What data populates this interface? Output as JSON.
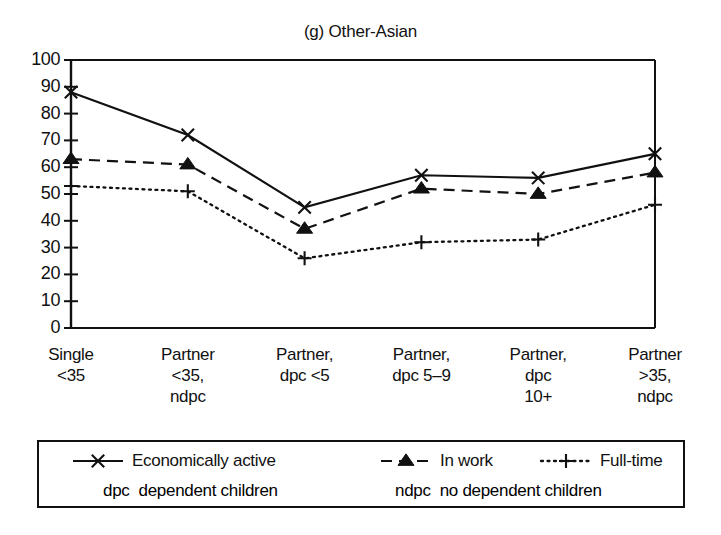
{
  "chart_data": {
    "type": "line",
    "title": "(g) Other-Asian",
    "xlabel": "",
    "ylabel": "",
    "ylim": [
      0,
      100
    ],
    "ytick_step": 10,
    "grid": false,
    "legend_position": "below-plot",
    "categories": [
      "Single\n<35",
      "Partner\n<35,\nndpc",
      "Partner,\ndpc <5",
      "Partner,\ndpc 5–9",
      "Partner,\ndpc\n10+",
      "Partner\n>35,\nndpc"
    ],
    "yticks": [
      "0",
      "10",
      "20",
      "30",
      "40",
      "50",
      "60",
      "70",
      "80",
      "90",
      "100"
    ],
    "series": [
      {
        "name": "Economically active",
        "marker": "cross-x",
        "linestyle": "solid",
        "color": "#111111",
        "values": [
          88,
          72,
          45,
          57,
          56,
          65
        ]
      },
      {
        "name": "In work",
        "marker": "triangle-up-filled",
        "linestyle": "dashed",
        "color": "#111111",
        "values": [
          63,
          61,
          37,
          52,
          50,
          58
        ]
      },
      {
        "name": "Full-time",
        "marker": "plus",
        "linestyle": "dotted",
        "color": "#111111",
        "values": [
          53,
          51,
          26,
          32,
          33,
          46
        ]
      }
    ]
  },
  "legend": {
    "entries": [
      {
        "label": "Economically active"
      },
      {
        "label": "In work"
      },
      {
        "label": "Full-time"
      }
    ],
    "notes": [
      {
        "abbr": "dpc",
        "text": "dependent children"
      },
      {
        "abbr": "ndpc",
        "text": "no dependent children"
      }
    ]
  },
  "colors": {
    "ink": "#111111",
    "background": "#ffffff"
  }
}
